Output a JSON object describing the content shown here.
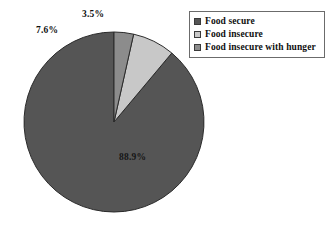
{
  "chart_data": {
    "type": "pie",
    "title": "",
    "subtitle": "",
    "xlabel": "",
    "ylabel": "",
    "legend_position": "top-right",
    "grid": false,
    "start_angle_deg": 90,
    "direction": "counterclockwise",
    "categories": [
      "Food secure",
      "Food insecure",
      "Food insecure with hunger"
    ],
    "values": [
      88.9,
      7.6,
      3.5
    ],
    "value_labels": [
      "88.9%",
      "7.6%",
      "3.5%"
    ],
    "slice_colors": [
      "#555555",
      "#c8c8c8",
      "#8c8c8c"
    ],
    "slices": [
      {
        "label": "Food secure",
        "value": 88.9,
        "value_label": "88.9%",
        "color": "#555555",
        "label_placement": "inside"
      },
      {
        "label": "Food insecure",
        "value": 7.6,
        "value_label": "7.6%",
        "color": "#c8c8c8",
        "label_placement": "outside"
      },
      {
        "label": "Food insecure with hunger",
        "value": 3.5,
        "value_label": "3.5%",
        "color": "#8c8c8c",
        "label_placement": "outside"
      }
    ]
  },
  "legend": {
    "items": [
      {
        "label": "Food secure",
        "color": "#555555"
      },
      {
        "label": "Food insecure",
        "color": "#c8c8c8"
      },
      {
        "label": "Food insecure with hunger",
        "color": "#8c8c8c"
      }
    ]
  },
  "geometry": {
    "center_x": 114,
    "center_y": 122,
    "radius": 90,
    "outline_color": "#2b2b2b"
  }
}
